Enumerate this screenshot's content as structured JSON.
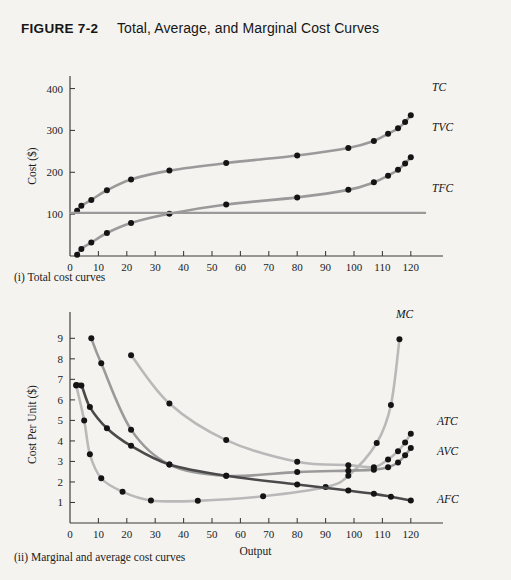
{
  "figure": {
    "number": "FIGURE 7-2",
    "title": "Total, Average, and Marginal Cost Curves"
  },
  "captions": {
    "panel_i": "(i) Total cost curves",
    "panel_ii": "(ii) Marginal and average cost curves"
  },
  "colors": {
    "background": "#f4f3f0",
    "axis": "#3a3a3a",
    "dot": "#141414",
    "text": "#1b1b1b",
    "curve_light": "#b9b9b9",
    "curve_mid": "#9a9a9a",
    "curve_dark": "#6e6e6e",
    "curve_darkest": "#4a4a4a"
  },
  "chart_data": [
    {
      "id": "total-cost-curves",
      "type": "line",
      "title": "",
      "xlabel": "Output",
      "ylabel": "Cost ($)",
      "xlim": [
        0,
        125
      ],
      "ylim": [
        0,
        430
      ],
      "xticks": [
        0,
        10,
        20,
        30,
        40,
        50,
        60,
        70,
        80,
        90,
        100,
        110,
        120
      ],
      "yticks": [
        100,
        200,
        300,
        400
      ],
      "grid": false,
      "legend_position": "inline-right",
      "series": [
        {
          "name": "TC",
          "label": "TC",
          "color": "#9a9a9a",
          "width": 2.6,
          "x": [
            2.5,
            4,
            7.5,
            13,
            21.5,
            35,
            55,
            80,
            98,
            107,
            112,
            115.5,
            118,
            120
          ],
          "y": [
            108,
            120,
            134,
            157,
            183,
            204,
            222,
            240,
            258,
            275,
            292,
            305,
            320,
            336
          ]
        },
        {
          "name": "TVC",
          "label": "TVC",
          "color": "#9a9a9a",
          "width": 2.6,
          "x": [
            2.5,
            4,
            7.5,
            13,
            21.5,
            35,
            55,
            80,
            98,
            107,
            112,
            115.5,
            118,
            120
          ],
          "y": [
            3,
            17,
            32,
            55,
            79,
            101,
            123,
            140,
            158,
            176,
            192,
            206,
            221,
            236
          ]
        },
        {
          "name": "TFC",
          "label": "TFC",
          "color": "#9a9a9a",
          "width": 2.4,
          "x": [
            0,
            125
          ],
          "y": [
            103,
            103
          ]
        }
      ]
    },
    {
      "id": "marginal-average-cost-curves",
      "type": "line",
      "title": "",
      "xlabel": "Output",
      "ylabel": "Cost Per Unit ($)",
      "xlim": [
        0,
        125
      ],
      "ylim": [
        0,
        9.6
      ],
      "xticks": [
        0,
        10,
        20,
        30,
        40,
        50,
        60,
        70,
        80,
        90,
        100,
        110,
        120
      ],
      "yticks": [
        1,
        2,
        3,
        4,
        5,
        6,
        7,
        8,
        9
      ],
      "grid": false,
      "legend_position": "inline-right",
      "series": [
        {
          "name": "MC",
          "label": "MC",
          "color": "#b9b9b9",
          "width": 2.6,
          "x": [
            2.2,
            5,
            7,
            11,
            18.5,
            28.5,
            45,
            68,
            90,
            98,
            108,
            113,
            116
          ],
          "y": [
            6.7,
            5.0,
            3.35,
            2.18,
            1.52,
            1.1,
            1.08,
            1.3,
            1.75,
            2.3,
            3.9,
            5.75,
            8.95
          ]
        },
        {
          "name": "ATC",
          "label": "ATC",
          "color": "#b9b9b9",
          "width": 2.6,
          "x": [
            21.5,
            35,
            55,
            80,
            98,
            107,
            112,
            115.5,
            118,
            120
          ],
          "y": [
            8.18,
            5.82,
            4.04,
            2.98,
            2.82,
            2.72,
            3.1,
            3.5,
            3.92,
            4.35
          ]
        },
        {
          "name": "AVC",
          "label": "AVC",
          "color": "#9a9a9a",
          "width": 2.6,
          "x": [
            7.5,
            11,
            21.5,
            35,
            55,
            80,
            98,
            107,
            112,
            115.5,
            118,
            120
          ],
          "y": [
            9.0,
            7.78,
            4.55,
            2.85,
            2.3,
            2.48,
            2.55,
            2.6,
            2.72,
            2.95,
            3.3,
            3.65
          ]
        },
        {
          "name": "AFC",
          "label": "AFC",
          "color": "#4a4a4a",
          "width": 2.6,
          "x": [
            2.2,
            4,
            7,
            13,
            21.5,
            35,
            55,
            80,
            98,
            107,
            113,
            120
          ],
          "y": [
            6.72,
            6.7,
            5.65,
            4.62,
            3.76,
            2.85,
            2.3,
            1.88,
            1.58,
            1.42,
            1.28,
            1.1
          ]
        }
      ]
    }
  ]
}
